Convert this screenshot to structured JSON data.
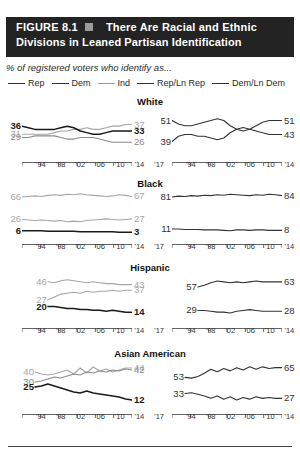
{
  "figure": {
    "label": "FIGURE 8.1",
    "marker_icon": "square-marker",
    "title_line1": "There Are Racial and Ethnic",
    "title_line2": "Divisions in Leaned Partisan Identification",
    "subtitle": "% of registered voters who identify as...",
    "banner_color": "#232323"
  },
  "legend": {
    "position": "top",
    "items": [
      {
        "label": "Rep",
        "color": "#333333"
      },
      {
        "label": "Dem",
        "color": "#333333"
      },
      {
        "label": "Ind",
        "color": "#9b9b9b"
      },
      {
        "label": "Rep/Ln Rep",
        "color": "#333333"
      },
      {
        "label": "Dem/Ln Dem",
        "color": "#333333"
      }
    ]
  },
  "axis": {
    "ticks": [
      "'94",
      "'98",
      "'02",
      "'06",
      "'10",
      "'14",
      "'17"
    ]
  },
  "groups": [
    {
      "title": "White"
    },
    {
      "title": "Black"
    },
    {
      "title": "Hispanic"
    },
    {
      "title": "Asian American"
    }
  ],
  "chart_data": {
    "type": "line",
    "title": "There Are Racial and Ethnic Divisions in Leaned Partisan Identification",
    "subtitle": "% of registered voters who identify as...",
    "xlabel": "",
    "ylabel": "% of registered voters",
    "x": [
      "'94",
      "'98",
      "'02",
      "'06",
      "'10",
      "'14",
      "'17"
    ],
    "xlim": [
      1994,
      2017
    ],
    "ylim": [
      0,
      100
    ],
    "grid": false,
    "legend": [
      "Rep",
      "Dem",
      "Ind",
      "Rep/Ln Rep",
      "Dem/Ln Dem"
    ],
    "panels": [
      {
        "group": "White",
        "side": "left",
        "series": [
          {
            "name": "Ind",
            "color": "#a6a6a6",
            "start_value": 31,
            "end_value": 37,
            "values": [
              31,
              31,
              31,
              31,
              31,
              32,
              33,
              33,
              34,
              34,
              35,
              34,
              34,
              35,
              36,
              36,
              37,
              37
            ]
          },
          {
            "name": "Rep",
            "color": "#1a1a1a",
            "start_value": 36,
            "end_value": 33,
            "values": [
              36,
              35,
              34,
              34,
              34,
              34,
              35,
              36,
              35,
              33,
              32,
              31,
              31,
              32,
              33,
              33,
              33,
              33
            ]
          },
          {
            "name": "Dem",
            "color": "#8c8c8c",
            "start_value": 29,
            "end_value": 26,
            "values": [
              29,
              29,
              30,
              30,
              30,
              30,
              29,
              28,
              28,
              29,
              29,
              29,
              28,
              27,
              26,
              26,
              26,
              26
            ]
          }
        ]
      },
      {
        "group": "White",
        "side": "right",
        "series": [
          {
            "name": "Rep/Ln Rep",
            "color": "#333333",
            "start_value": 51,
            "end_value": 51,
            "values": [
              51,
              49,
              48,
              48,
              49,
              50,
              51,
              52,
              51,
              48,
              46,
              45,
              46,
              48,
              50,
              51,
              51,
              51
            ]
          },
          {
            "name": "Dem/Ln Dem",
            "color": "#333333",
            "start_value": 39,
            "end_value": 43,
            "values": [
              39,
              42,
              43,
              43,
              42,
              42,
              41,
              40,
              41,
              44,
              46,
              47,
              46,
              45,
              44,
              43,
              43,
              43
            ]
          }
        ]
      },
      {
        "group": "Black",
        "side": "left",
        "series": [
          {
            "name": "Dem",
            "color": "#a6a6a6",
            "start_value": 66,
            "end_value": 67,
            "values": [
              66,
              67,
              68,
              67,
              69,
              70,
              69,
              71,
              70,
              72,
              70,
              69,
              68,
              67,
              68,
              70,
              69,
              67
            ]
          },
          {
            "name": "Ind",
            "color": "#a6a6a6",
            "start_value": 26,
            "end_value": 27,
            "values": [
              26,
              25,
              24,
              25,
              24,
              23,
              24,
              22,
              23,
              22,
              24,
              25,
              26,
              27,
              26,
              25,
              26,
              27
            ]
          },
          {
            "name": "Rep",
            "color": "#1a1a1a",
            "start_value": 6,
            "end_value": 3,
            "values": [
              6,
              6,
              6,
              6,
              5,
              5,
              5,
              5,
              5,
              4,
              4,
              4,
              4,
              4,
              4,
              3,
              3,
              3
            ]
          }
        ]
      },
      {
        "group": "Black",
        "side": "right",
        "series": [
          {
            "name": "Dem/Ln Dem",
            "color": "#333333",
            "start_value": 81,
            "end_value": 84,
            "values": [
              81,
              83,
              82,
              84,
              83,
              85,
              84,
              86,
              85,
              87,
              86,
              85,
              84,
              86,
              85,
              87,
              86,
              84
            ]
          },
          {
            "name": "Rep/Ln Rep",
            "color": "#333333",
            "start_value": 11,
            "end_value": 8,
            "values": [
              11,
              11,
              10,
              10,
              10,
              9,
              9,
              9,
              8,
              7,
              9,
              9,
              8,
              9,
              9,
              8,
              8,
              8
            ]
          }
        ]
      },
      {
        "group": "Hispanic",
        "side": "left",
        "start_index": 4,
        "series": [
          {
            "name": "Dem",
            "color": "#a6a6a6",
            "start_value": 46,
            "end_value": 43,
            "values": [
              46,
              45,
              47,
              48,
              47,
              46,
              45,
              46,
              45,
              44,
              44,
              43,
              43,
              43
            ]
          },
          {
            "name": "Ind",
            "color": "#a6a6a6",
            "start_value": 27,
            "end_value": 37,
            "values": [
              27,
              30,
              33,
              34,
              35,
              34,
              36,
              35,
              36,
              36,
              37,
              36,
              37,
              37
            ]
          },
          {
            "name": "Rep",
            "color": "#1a1a1a",
            "start_value": 20,
            "end_value": 14,
            "values": [
              20,
              20,
              19,
              18,
              18,
              17,
              17,
              16,
              16,
              15,
              16,
              15,
              14,
              14
            ]
          }
        ]
      },
      {
        "group": "Hispanic",
        "side": "right",
        "start_index": 4,
        "series": [
          {
            "name": "Dem/Ln Dem",
            "color": "#333333",
            "start_value": 57,
            "end_value": 63,
            "values": [
              57,
              59,
              62,
              64,
              63,
              62,
              63,
              62,
              63,
              64,
              63,
              63,
              63,
              63
            ]
          },
          {
            "name": "Rep/Ln Rep",
            "color": "#333333",
            "start_value": 29,
            "end_value": 28,
            "values": [
              29,
              29,
              28,
              27,
              27,
              26,
              28,
              29,
              30,
              29,
              28,
              28,
              28,
              28
            ]
          }
        ]
      },
      {
        "group": "Asian American",
        "side": "left",
        "start_index": 2,
        "series": [
          {
            "name": "Ind",
            "color": "#a6a6a6",
            "start_value": 40,
            "end_value": 44,
            "values": [
              40,
              38,
              37,
              38,
              40,
              42,
              38,
              44,
              39,
              45,
              41,
              43,
              40,
              42,
              44,
              44
            ]
          },
          {
            "name": "Dem",
            "color": "#8c8c8c",
            "start_value": 30,
            "end_value": 42,
            "values": [
              30,
              31,
              33,
              35,
              34,
              36,
              38,
              37,
              40,
              39,
              41,
              40,
              42,
              41,
              43,
              42
            ]
          },
          {
            "name": "Rep",
            "color": "#1a1a1a",
            "start_value": 25,
            "end_value": 12,
            "values": [
              25,
              26,
              28,
              26,
              24,
              22,
              20,
              19,
              21,
              19,
              18,
              17,
              16,
              15,
              13,
              12
            ]
          }
        ]
      },
      {
        "group": "Asian American",
        "side": "right",
        "start_index": 2,
        "series": [
          {
            "name": "Dem/Ln Dem",
            "color": "#333333",
            "start_value": 53,
            "end_value": 65,
            "values": [
              53,
              52,
              54,
              58,
              63,
              60,
              64,
              61,
              65,
              62,
              66,
              63,
              66,
              64,
              65,
              65
            ]
          },
          {
            "name": "Rep/Ln Rep",
            "color": "#333333",
            "start_value": 33,
            "end_value": 27,
            "values": [
              33,
              34,
              32,
              30,
              27,
              30,
              26,
              29,
              25,
              28,
              26,
              29,
              27,
              28,
              27,
              27
            ]
          }
        ]
      }
    ]
  }
}
